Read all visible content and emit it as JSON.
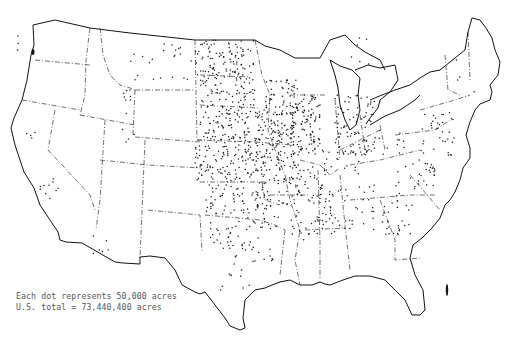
{
  "map": {
    "title": "",
    "type": "dot-density",
    "region": "Contiguous United States",
    "colors": {
      "dot": "#1a1a1a",
      "outline": "#111111",
      "border": "#333333",
      "background": "#ffffff",
      "legend_text": "#555555"
    }
  },
  "legend": {
    "line1": "Each dot represents 50,000 acres",
    "line2": "U.S. total = 73,440,400 acres"
  },
  "chart_data": {
    "type": "dot-density-map",
    "title": "",
    "unit_per_dot": 50000,
    "unit": "acres",
    "total": 73440400,
    "annotations": [
      "Each dot represents 50,000 acres",
      "U.S. total = 73,440,400 acres"
    ],
    "regions": [
      {
        "name": "Corn Belt / Iowa-Illinois",
        "density": "very high"
      },
      {
        "name": "Great Plains (Dakotas, Nebraska, Kansas)",
        "density": "high"
      },
      {
        "name": "Indiana-Ohio",
        "density": "high"
      },
      {
        "name": "Mississippi Delta",
        "density": "medium"
      },
      {
        "name": "Southeast (Georgia, Carolinas)",
        "density": "medium"
      },
      {
        "name": "Texas / Oklahoma",
        "density": "medium"
      },
      {
        "name": "Mid-Atlantic",
        "density": "medium"
      },
      {
        "name": "Montana",
        "density": "low"
      },
      {
        "name": "California Central Valley",
        "density": "low"
      },
      {
        "name": "Mountain West",
        "density": "very low"
      },
      {
        "name": "New England",
        "density": "very low"
      }
    ]
  },
  "dot_regions": [
    {
      "x": 10,
      "y": 30,
      "w": 12,
      "h": 20,
      "n": 3
    },
    {
      "x": 123,
      "y": 40,
      "w": 70,
      "h": 45,
      "n": 22
    },
    {
      "x": 120,
      "y": 90,
      "w": 15,
      "h": 25,
      "n": 8
    },
    {
      "x": 110,
      "y": 125,
      "w": 30,
      "h": 20,
      "n": 4
    },
    {
      "x": 40,
      "y": 170,
      "w": 20,
      "h": 30,
      "n": 10
    },
    {
      "x": 25,
      "y": 125,
      "w": 10,
      "h": 15,
      "n": 4
    },
    {
      "x": 90,
      "y": 230,
      "w": 40,
      "h": 25,
      "n": 6
    },
    {
      "x": 195,
      "y": 40,
      "w": 60,
      "h": 35,
      "n": 95
    },
    {
      "x": 200,
      "y": 75,
      "w": 55,
      "h": 38,
      "n": 85
    },
    {
      "x": 200,
      "y": 113,
      "w": 50,
      "h": 30,
      "n": 80
    },
    {
      "x": 195,
      "y": 145,
      "w": 60,
      "h": 38,
      "n": 110
    },
    {
      "x": 255,
      "y": 110,
      "w": 40,
      "h": 55,
      "n": 150
    },
    {
      "x": 265,
      "y": 80,
      "w": 35,
      "h": 35,
      "n": 55
    },
    {
      "x": 290,
      "y": 95,
      "w": 30,
      "h": 60,
      "n": 110
    },
    {
      "x": 250,
      "y": 165,
      "w": 45,
      "h": 40,
      "n": 70
    },
    {
      "x": 205,
      "y": 185,
      "w": 40,
      "h": 30,
      "n": 45
    },
    {
      "x": 245,
      "y": 205,
      "w": 35,
      "h": 25,
      "n": 30
    },
    {
      "x": 210,
      "y": 220,
      "w": 35,
      "h": 30,
      "n": 30
    },
    {
      "x": 245,
      "y": 235,
      "w": 30,
      "h": 30,
      "n": 15
    },
    {
      "x": 220,
      "y": 255,
      "w": 30,
      "h": 40,
      "n": 12
    },
    {
      "x": 295,
      "y": 160,
      "w": 30,
      "h": 40,
      "n": 40
    },
    {
      "x": 315,
      "y": 190,
      "w": 20,
      "h": 50,
      "n": 35
    },
    {
      "x": 290,
      "y": 200,
      "w": 25,
      "h": 40,
      "n": 20
    },
    {
      "x": 335,
      "y": 95,
      "w": 40,
      "h": 60,
      "n": 90
    },
    {
      "x": 320,
      "y": 150,
      "w": 40,
      "h": 25,
      "n": 20
    },
    {
      "x": 335,
      "y": 185,
      "w": 40,
      "h": 45,
      "n": 30
    },
    {
      "x": 380,
      "y": 190,
      "w": 35,
      "h": 45,
      "n": 30
    },
    {
      "x": 395,
      "y": 160,
      "w": 40,
      "h": 30,
      "n": 30
    },
    {
      "x": 420,
      "y": 110,
      "w": 35,
      "h": 50,
      "n": 35
    },
    {
      "x": 365,
      "y": 125,
      "w": 40,
      "h": 30,
      "n": 15
    },
    {
      "x": 345,
      "y": 35,
      "w": 25,
      "h": 30,
      "n": 6
    },
    {
      "x": 455,
      "y": 55,
      "w": 20,
      "h": 40,
      "n": 4
    }
  ]
}
